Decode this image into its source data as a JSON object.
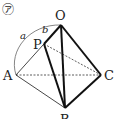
{
  "figure": {
    "marker": "㋐",
    "points": {
      "O": {
        "label": "O",
        "x": 61,
        "y": 25
      },
      "P": {
        "label": "P",
        "x": 44,
        "y": 44
      },
      "A": {
        "label": "A",
        "x": 16,
        "y": 75
      },
      "B": {
        "label": "B",
        "x": 65,
        "y": 108
      },
      "C": {
        "label": "C",
        "x": 101,
        "y": 75
      }
    },
    "segment_labels": {
      "a": "a",
      "b": "b"
    },
    "colors": {
      "line": "#1a1a1a",
      "thin": "#333333",
      "arc": "#555555"
    }
  }
}
